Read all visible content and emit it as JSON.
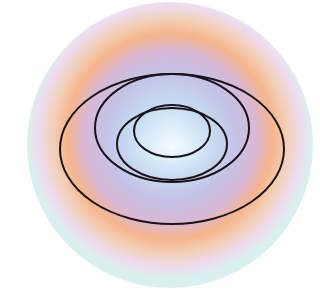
{
  "diagram": {
    "type": "nested-ellipses",
    "background": "#ffffff",
    "disc": {
      "cx": 170,
      "cy": 145,
      "r": 143,
      "gradient_stops": [
        {
          "offset": "0%",
          "color": "#f2fbff"
        },
        {
          "offset": "22%",
          "color": "#c6def4"
        },
        {
          "offset": "45%",
          "color": "#c4c2e6"
        },
        {
          "offset": "60%",
          "color": "#d8b8d6"
        },
        {
          "offset": "72%",
          "color": "#f6b58c"
        },
        {
          "offset": "82%",
          "color": "#f2d0b8"
        },
        {
          "offset": "92%",
          "color": "#eedcf0"
        },
        {
          "offset": "100%",
          "color": "#d9f1ee"
        }
      ]
    },
    "stroke_color": "#1a1418",
    "ellipses": [
      {
        "name": "outer-ellipse",
        "cx": 172,
        "cy": 149,
        "rx": 112,
        "ry": 75
      },
      {
        "name": "large-ellipse",
        "cx": 172,
        "cy": 128,
        "rx": 77,
        "ry": 54
      },
      {
        "name": "middle-ellipse",
        "cx": 172,
        "cy": 144,
        "rx": 55,
        "ry": 36
      },
      {
        "name": "inner-ellipse",
        "cx": 172,
        "cy": 131,
        "rx": 38,
        "ry": 26
      }
    ]
  }
}
